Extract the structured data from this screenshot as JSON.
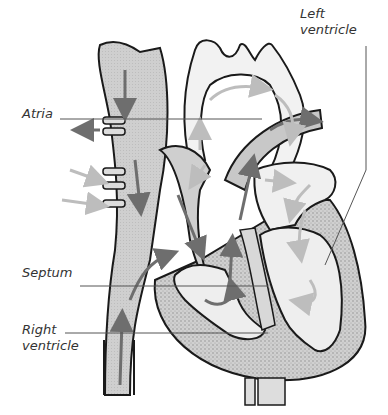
{
  "diagram": {
    "labels": {
      "left_ventricle": "Left\nventricle",
      "atria": "Atria",
      "septum": "Septum",
      "right_ventricle": "Right\nventricle"
    },
    "caption_partial": "",
    "colors": {
      "outline": "#1a1a1a",
      "vessel_fill": "#c8c8c8",
      "chamber_fill": "#e8e8e8",
      "muscle_fill": "#d4d4d4",
      "dark_arrow": "#6e6e6e",
      "light_arrow": "#bdbdbd",
      "leader_line": "#555555",
      "background": "#ffffff"
    }
  }
}
